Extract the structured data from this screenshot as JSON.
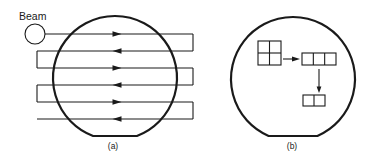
{
  "figure": {
    "panel_a": {
      "caption": "(a)",
      "beam_label": "Beam",
      "beam_circle": {
        "cx": 35,
        "cy": 34,
        "r": 10
      },
      "wafer": {
        "cx": 115,
        "cy": 78,
        "r": 62,
        "flat_y": 136
      },
      "scan_lines": [
        {
          "y": 34,
          "x1": 45,
          "x2": 193,
          "direction": "right"
        },
        {
          "y": 51,
          "x1": 37,
          "x2": 193,
          "direction": "left"
        },
        {
          "y": 68,
          "x1": 37,
          "x2": 193,
          "direction": "right"
        },
        {
          "y": 85,
          "x1": 37,
          "x2": 193,
          "direction": "left"
        },
        {
          "y": 102,
          "x1": 37,
          "x2": 193,
          "direction": "right"
        },
        {
          "y": 119,
          "x1": 37,
          "x2": 193,
          "direction": "left"
        }
      ],
      "arrow_x": 117,
      "right_turns": [
        [
          34,
          51
        ],
        [
          68,
          85
        ],
        [
          102,
          119
        ]
      ],
      "left_turns": [
        [
          51,
          68
        ],
        [
          85,
          102
        ]
      ],
      "right_turn_x": 193,
      "left_turn_x": 37
    },
    "panel_b": {
      "caption": "(b)",
      "wafer": {
        "cx": 293,
        "cy": 79,
        "r": 62,
        "flat_y": 136
      },
      "grid_2x2": {
        "x": 258,
        "y": 41,
        "w": 23,
        "h": 24,
        "cols": 2,
        "rows": 2
      },
      "grid_1x3": {
        "x": 302,
        "y": 53,
        "w": 34,
        "h": 12,
        "cols": 3,
        "rows": 1
      },
      "grid_1x2": {
        "x": 303,
        "y": 95,
        "w": 22,
        "h": 11,
        "cols": 2,
        "rows": 1
      },
      "arrow_right": {
        "x1": 283,
        "y1": 59,
        "x2": 300,
        "y2": 59
      },
      "arrow_down": {
        "x1": 319,
        "y1": 69,
        "x2": 319,
        "y2": 93
      }
    }
  }
}
